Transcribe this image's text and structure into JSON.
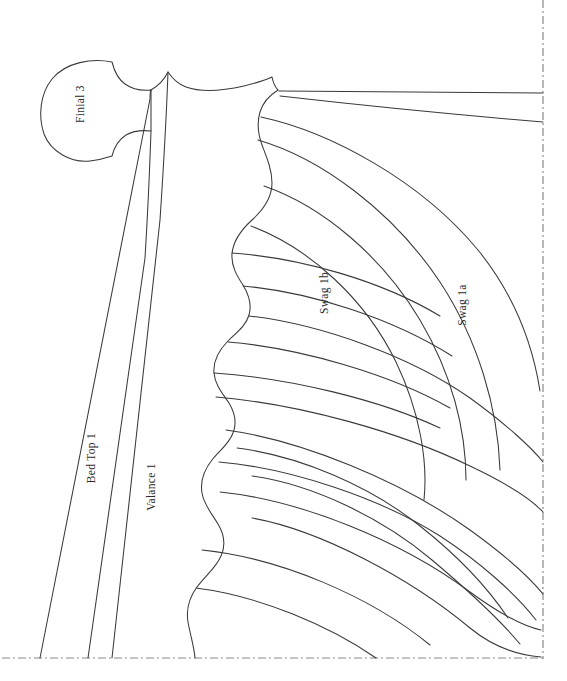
{
  "document": {
    "type": "sewing-pattern-line-drawing",
    "subject": "Bed canopy drapery pattern — finial, bed top, valance and swags",
    "background_color": "#ffffff",
    "line_color": "#3a3a3a",
    "centerline_color": "#8a8a8a"
  },
  "labels": {
    "finial": "Finial 3",
    "bed_top": "Bed Top 1",
    "valance": "Valance 1",
    "swag_1b": "Swag 1b",
    "swag_1a": "Swag 1a"
  },
  "label_positions": {
    "finial": {
      "x": 84,
      "y": 104,
      "rotate": -90
    },
    "bed_top": {
      "x": 95,
      "y": 458,
      "rotate": -90
    },
    "valance": {
      "x": 155,
      "y": 487,
      "rotate": -90
    },
    "swag_1b": {
      "x": 328,
      "y": 293,
      "rotate": -90
    },
    "swag_1a": {
      "x": 466,
      "y": 305,
      "rotate": -90
    }
  },
  "centerlines": {
    "vertical": {
      "x": 543,
      "y1": 0,
      "y2": 659
    },
    "horizontal": {
      "y": 658,
      "x1": 2,
      "x2": 544
    },
    "dash_pattern": "8 3 2 3"
  },
  "pieces": [
    {
      "name": "Finial 3",
      "kind": "finial-cap",
      "closed": true
    },
    {
      "name": "Bed Top 1",
      "kind": "tapered-strip",
      "closed": false
    },
    {
      "name": "Valance 1",
      "kind": "scalloped-panel",
      "closed": false
    },
    {
      "name": "Swag 1b",
      "kind": "nested-arc-swag",
      "closed": false
    },
    {
      "name": "Swag 1a",
      "kind": "nested-arc-swag",
      "closed": false
    }
  ]
}
